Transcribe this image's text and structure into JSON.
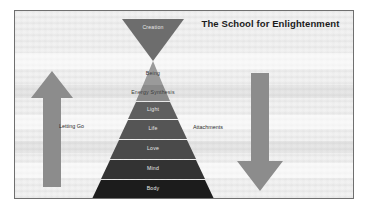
{
  "slide": {
    "title": "The School for Enlightenment",
    "background_color": "#f2f2f2",
    "border_color": "#6f6f6f"
  },
  "pyramid": {
    "apex_is_inverted_triangle": true,
    "tiers": [
      {
        "label": "Creation",
        "color": "#6d6d6d",
        "shape": "inverted-apex"
      },
      {
        "label": "Being",
        "color": "#9a9a9a",
        "shape": "band"
      },
      {
        "label": "Energy Synthesis",
        "color": "#8a8a8a",
        "shape": "band"
      },
      {
        "label": "Light",
        "color": "#5f5f5f",
        "shape": "band"
      },
      {
        "label": "Life",
        "color": "#555555",
        "shape": "band"
      },
      {
        "label": "Love",
        "color": "#4a4a4a",
        "shape": "band"
      },
      {
        "label": "Mind",
        "color": "#333333",
        "shape": "band"
      },
      {
        "label": "Body",
        "color": "#1c1c1c",
        "shape": "band"
      }
    ]
  },
  "arrows": {
    "left": {
      "direction": "up",
      "label": "Letting Go",
      "color": "#8c8c8c"
    },
    "right": {
      "direction": "down",
      "label": "Attachments",
      "color": "#8c8c8c"
    }
  }
}
